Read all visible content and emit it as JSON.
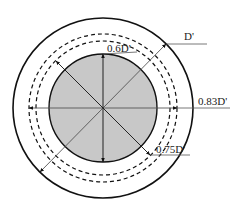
{
  "diagram": {
    "labels": {
      "outer": "D'",
      "inner": "0.6D'",
      "dashed_outer": "0.83D'",
      "dashed_inner": "0.75D'"
    },
    "colors": {
      "fill": "#c8c8c8",
      "stroke": "#111111"
    }
  }
}
